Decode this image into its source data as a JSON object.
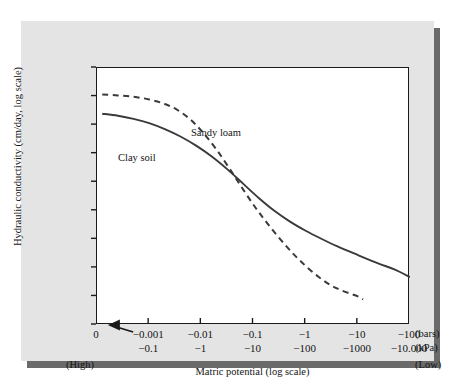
{
  "figure": {
    "background_color": "#e4e4e4",
    "plot_background_color": "#ffffff",
    "axis_color": "#1a1a1a",
    "shadow_color": "#6a6a6a"
  },
  "chart_data": {
    "type": "line",
    "title": "",
    "xlabel": "Matric potential (log scale)",
    "ylabel": "Hydraulic conductivity (cm/day, log scale)",
    "xscale": "log",
    "yscale": "log",
    "grid": false,
    "legend_position": "inline-annotation",
    "y_tick_labels": [
      "10³",
      "10²",
      "10",
      "1",
      "10⁻¹",
      "10⁻²",
      "10⁻³",
      "10⁻⁴",
      "10⁻⁵",
      "10⁻⁶"
    ],
    "y_tick_mantissas": [
      "10",
      "10",
      "10",
      "1",
      "10",
      "10",
      "10",
      "10",
      "10",
      "10"
    ],
    "y_tick_exponents": [
      "3",
      "2",
      "",
      "",
      "-1",
      "-2",
      "-3",
      "-4",
      "-5",
      "-6"
    ],
    "y_tick_exponents_log10": [
      3,
      2,
      1,
      0,
      -1,
      -2,
      -3,
      -4,
      -5,
      -6
    ],
    "ylim_log10": [
      -6,
      3
    ],
    "x_tick_labels_bars": [
      "0",
      "−0.001",
      "−0.01",
      "−0.1",
      "−1",
      "−10",
      "−100"
    ],
    "x_tick_labels_kpa": [
      "",
      "−0.1",
      "−1",
      "−10",
      "−100",
      "−1000",
      "−10.000"
    ],
    "x_unit_bars": "(bars)",
    "x_unit_kpa": "(kPa)",
    "x_left_annotation": "(High)",
    "x_right_annotation": "(Low)",
    "x_axis_arrow": "left-arrow-toward-zero",
    "series": [
      {
        "name": "Sandy loam",
        "style": "dashed",
        "color": "#3a3a3a",
        "label_x_bars": "−0.1",
        "points_log10": [
          [
            0.1,
            2.07
          ],
          [
            0.4,
            2.04
          ],
          [
            0.7,
            1.99
          ],
          [
            1.0,
            1.9
          ],
          [
            1.3,
            1.74
          ],
          [
            1.55,
            1.52
          ],
          [
            1.8,
            1.18
          ],
          [
            2.05,
            0.7
          ],
          [
            2.3,
            0.12
          ],
          [
            2.55,
            -0.55
          ],
          [
            2.8,
            -1.25
          ],
          [
            3.05,
            -1.92
          ],
          [
            3.3,
            -2.52
          ],
          [
            3.6,
            -3.18
          ],
          [
            3.9,
            -3.76
          ],
          [
            4.25,
            -4.32
          ],
          [
            4.6,
            -4.72
          ],
          [
            5.0,
            -5.0
          ],
          [
            5.1,
            -5.1
          ]
        ]
      },
      {
        "name": "Clay soil",
        "style": "solid",
        "color": "#3a3a3a",
        "label_x_bars": "−0.01",
        "points_log10": [
          [
            0.1,
            1.4
          ],
          [
            0.4,
            1.33
          ],
          [
            0.7,
            1.22
          ],
          [
            1.0,
            1.07
          ],
          [
            1.3,
            0.86
          ],
          [
            1.6,
            0.6
          ],
          [
            1.9,
            0.28
          ],
          [
            2.2,
            -0.1
          ],
          [
            2.5,
            -0.55
          ],
          [
            2.8,
            -1.05
          ],
          [
            3.1,
            -1.55
          ],
          [
            3.4,
            -2.0
          ],
          [
            3.7,
            -2.38
          ],
          [
            4.0,
            -2.7
          ],
          [
            4.3,
            -2.98
          ],
          [
            4.6,
            -3.24
          ],
          [
            5.0,
            -3.55
          ],
          [
            5.4,
            -3.85
          ],
          [
            5.7,
            -4.05
          ],
          [
            6.0,
            -4.32
          ]
        ]
      }
    ]
  },
  "series_labels": {
    "sandy_loam": "Sandy loam",
    "clay_soil": "Clay soil"
  }
}
